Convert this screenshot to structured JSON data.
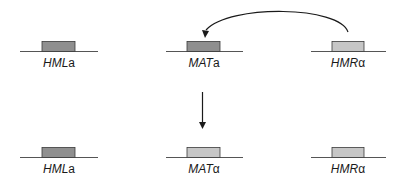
{
  "diagram": {
    "colors": {
      "a_cassette_fill": "#8f8f8f",
      "alpha_cassette_fill": "#c6c6c6",
      "outline": "#3a3a3a",
      "line": "#555555",
      "arrow": "#1a1a1a"
    },
    "top_row": {
      "loci": [
        {
          "name": "HML",
          "allele": "a",
          "type": "a"
        },
        {
          "name": "MAT",
          "allele": "a",
          "type": "a"
        },
        {
          "name": "HMR",
          "allele": "α",
          "type": "alpha"
        }
      ]
    },
    "bottom_row": {
      "loci": [
        {
          "name": "HML",
          "allele": "a",
          "type": "a"
        },
        {
          "name": "MAT",
          "allele": "α",
          "type": "alpha"
        },
        {
          "name": "HMR",
          "allele": "α",
          "type": "alpha"
        }
      ]
    },
    "arrows": [
      {
        "id": "copy-arc",
        "from": "HMRα",
        "to": "MATa",
        "shape": "curved"
      },
      {
        "id": "transition-arrow",
        "from": "top_row",
        "to": "bottom_row",
        "shape": "straight-down"
      }
    ]
  }
}
